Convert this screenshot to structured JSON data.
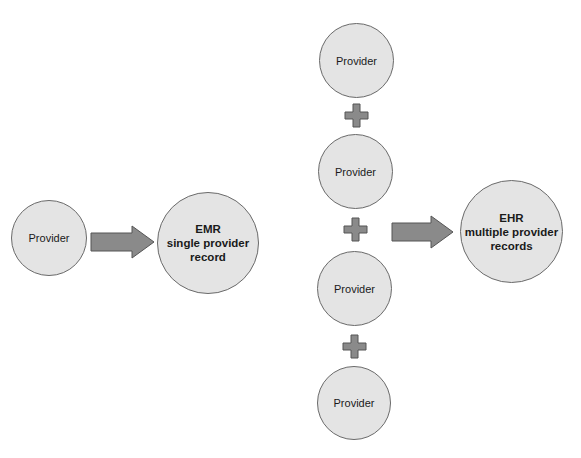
{
  "diagram": {
    "colors": {
      "circle_fill": "#e4e4e4",
      "circle_stroke": "#6a6a6a",
      "shape_fill": "#8a8a8a",
      "shape_stroke": "#555555"
    },
    "left": {
      "provider_label": "Provider",
      "emr_label": "EMR\nsingle provider\nrecord"
    },
    "right": {
      "providers": [
        "Provider",
        "Provider",
        "Provider",
        "Provider"
      ],
      "ehr_label": "EHR\nmultiple provider\nrecords"
    },
    "icons": {
      "arrow": "right-arrow",
      "plus": "plus-sign"
    }
  }
}
